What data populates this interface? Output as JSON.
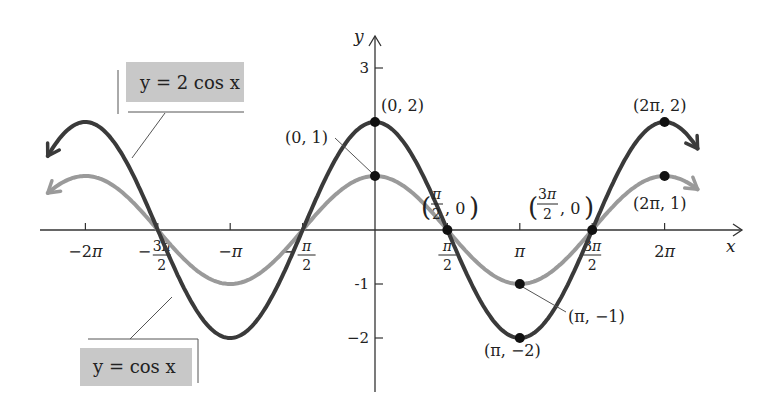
{
  "chart_data": {
    "type": "line",
    "title": "",
    "xlabel": "x",
    "ylabel": "y",
    "xlim": [
      -6.9,
      7.2
    ],
    "ylim": [
      -2.9,
      3.5
    ],
    "grid": false,
    "x_ticks": [
      {
        "value": -6.2832,
        "label": "−2π"
      },
      {
        "value": -4.7124,
        "label": "−3π/2"
      },
      {
        "value": -3.1416,
        "label": "−π"
      },
      {
        "value": -1.5708,
        "label": "−π/2"
      },
      {
        "value": 1.5708,
        "label": "π/2"
      },
      {
        "value": 3.1416,
        "label": "π"
      },
      {
        "value": 4.7124,
        "label": "3π/2"
      },
      {
        "value": 6.2832,
        "label": "2π"
      }
    ],
    "y_ticks": [
      {
        "value": 3,
        "label": "3"
      },
      {
        "value": -1,
        "label": "-1"
      },
      {
        "value": -2,
        "label": "−2"
      }
    ],
    "series": [
      {
        "name": "y = 2 cos x",
        "amplitude": 2,
        "color": "#3a3a3a",
        "x_range": [
          -7.1,
          7.0
        ]
      },
      {
        "name": "y = cos x",
        "amplitude": 1,
        "color": "#9a9a9a",
        "x_range": [
          -7.1,
          7.0
        ]
      }
    ],
    "points": [
      {
        "x": 0,
        "y": 2,
        "label": "(0, 2)"
      },
      {
        "x": 0,
        "y": 1,
        "label": "(0, 1)"
      },
      {
        "x": 1.5708,
        "y": 0,
        "label": "(π/2, 0)"
      },
      {
        "x": 4.7124,
        "y": 0,
        "label": "(3π/2, 0)"
      },
      {
        "x": 3.1416,
        "y": -1,
        "label": "(π, −1)"
      },
      {
        "x": 3.1416,
        "y": -2,
        "label": "(π, −2)"
      },
      {
        "x": 6.2832,
        "y": 2,
        "label": "(2π, 2)"
      },
      {
        "x": 6.2832,
        "y": 1,
        "label": "(2π, 1)"
      }
    ],
    "legend": [
      {
        "label": "y = 2 cos x",
        "position": "upper-left"
      },
      {
        "label": "y = cos x",
        "position": "lower-left"
      }
    ]
  },
  "labels": {
    "x_axis": "x",
    "y_axis": "y",
    "legend_2cos": "y = 2 cos x",
    "legend_cos": "y = cos x",
    "pt_0_2": "(0, 2)",
    "pt_0_1": "(0, 1)",
    "pt_2pi_2": "(2π, 2)",
    "pt_2pi_1": "(2π, 1)",
    "pt_pi_m1": "(π, −1)",
    "pt_pi_m2": "(π, −2)"
  },
  "colors": {
    "dark_curve": "#3a3a3a",
    "light_curve": "#9a9a9a",
    "legend_box": "#c8c8c8",
    "axis": "#333333"
  }
}
